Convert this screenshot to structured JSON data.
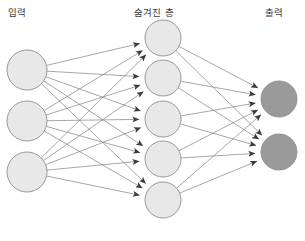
{
  "diagram": {
    "title_labels": {
      "input": "입력",
      "hidden": "숨겨진 층",
      "output": "출력"
    },
    "canvas": {
      "width": 305,
      "height": 241,
      "background": "#ffffff"
    },
    "style": {
      "node_fill_light": "#e8e8e8",
      "node_fill_dark": "#9a9a9a",
      "node_stroke": "#8f8f8f",
      "edge_color": "#8a8a8a",
      "label_color": "#3b3b3b"
    },
    "layers": [
      {
        "name": "input",
        "label": "입력",
        "node_radius": 20,
        "fill": "#e8e8e8",
        "nodes": [
          {
            "id": "i1",
            "cx": 27,
            "cy": 70
          },
          {
            "id": "i2",
            "cx": 27,
            "cy": 121
          },
          {
            "id": "i3",
            "cx": 27,
            "cy": 172
          }
        ]
      },
      {
        "name": "hidden",
        "label": "숨겨진 층",
        "node_radius": 18,
        "fill": "#e8e8e8",
        "nodes": [
          {
            "id": "h1",
            "cx": 163,
            "cy": 38
          },
          {
            "id": "h2",
            "cx": 163,
            "cy": 78
          },
          {
            "id": "h3",
            "cx": 163,
            "cy": 119
          },
          {
            "id": "h4",
            "cx": 163,
            "cy": 159
          },
          {
            "id": "h5",
            "cx": 163,
            "cy": 200
          }
        ]
      },
      {
        "name": "output",
        "label": "출력",
        "node_radius": 18,
        "fill": "#9a9a9a",
        "nodes": [
          {
            "id": "o1",
            "cx": 279,
            "cy": 99
          },
          {
            "id": "o2",
            "cx": 279,
            "cy": 152
          }
        ]
      }
    ],
    "connections": {
      "input_to_hidden": "fully-connected",
      "hidden_to_output": "fully-connected",
      "arrowheads": true,
      "direction": "left-to-right"
    },
    "counts": {
      "input_nodes": 3,
      "hidden_nodes": 5,
      "output_nodes": 2,
      "input_to_hidden_edges": 15,
      "hidden_to_output_edges": 10
    }
  }
}
